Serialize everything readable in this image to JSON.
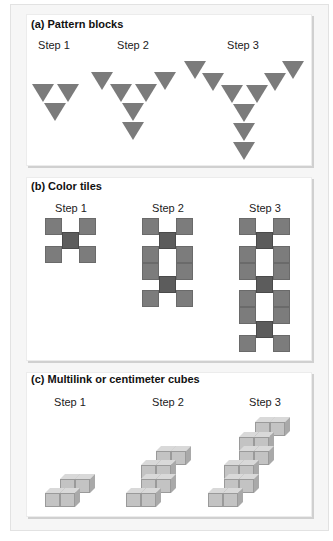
{
  "figure": {
    "panels": [
      {
        "id": "a",
        "title": "(a) Pattern blocks",
        "steps": [
          "Step 1",
          "Step 2",
          "Step 3"
        ],
        "shape": "triangle",
        "counts": [
          3,
          6,
          9
        ]
      },
      {
        "id": "b",
        "title": "(b) Color tiles",
        "steps": [
          "Step 1",
          "Step 2",
          "Step 3"
        ],
        "shape": "square-tile",
        "counts": [
          5,
          10,
          15
        ]
      },
      {
        "id": "c",
        "title": "(c) Multilink or centimeter cubes",
        "steps": [
          "Step 1",
          "Step 2",
          "Step 3"
        ],
        "shape": "cube",
        "counts": [
          4,
          8,
          12
        ]
      }
    ],
    "colors": {
      "triangle": "#7b7b7b",
      "tile": "#7c7c7c",
      "tile_center": "#5c5c5c",
      "cube_front": "#c3c3c3",
      "panel_bg": "#ffffff",
      "frame_bg": "#f6f6f6"
    }
  }
}
